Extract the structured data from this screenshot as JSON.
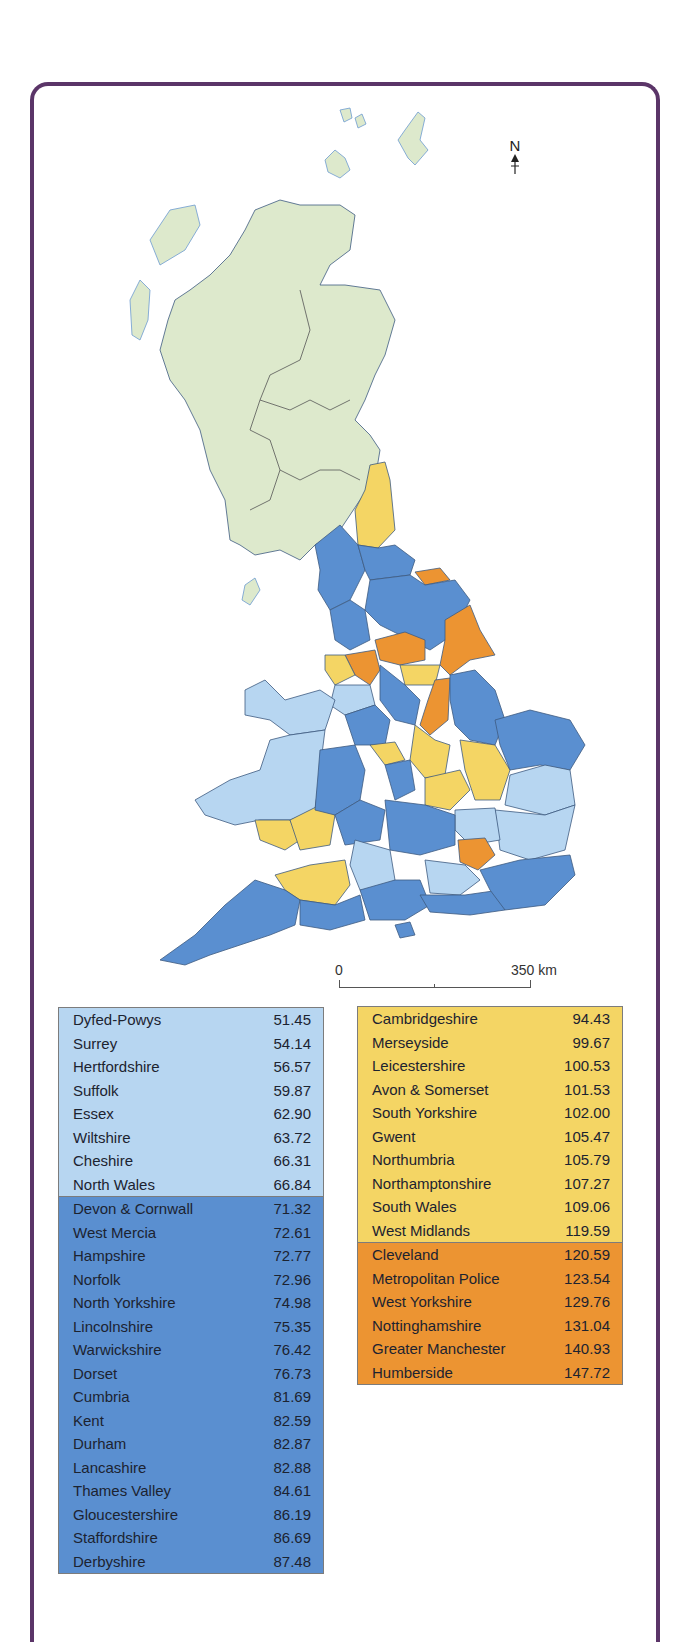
{
  "map": {
    "type": "choropleth",
    "subject": "UK police force areas",
    "north_label": "N",
    "scale": {
      "start_label": "0",
      "end_label": "350 km"
    },
    "colors": {
      "scotland_no_data": "#dde9cc",
      "class_1": "#b7d6f1",
      "class_2": "#5a8fd0",
      "class_3": "#f4d564",
      "class_4": "#ec9432",
      "frame": "#5b3568"
    }
  },
  "legend": {
    "left": {
      "groups": [
        {
          "class": "class_1",
          "items": [
            {
              "name": "Dyfed-Powys",
              "value": "51.45"
            },
            {
              "name": "Surrey",
              "value": "54.14"
            },
            {
              "name": "Hertfordshire",
              "value": "56.57"
            },
            {
              "name": "Suffolk",
              "value": "59.87"
            },
            {
              "name": "Essex",
              "value": "62.90"
            },
            {
              "name": "Wiltshire",
              "value": "63.72"
            },
            {
              "name": "Cheshire",
              "value": "66.31"
            },
            {
              "name": "North Wales",
              "value": "66.84"
            }
          ]
        },
        {
          "class": "class_2",
          "items": [
            {
              "name": "Devon & Cornwall",
              "value": "71.32"
            },
            {
              "name": "West Mercia",
              "value": "72.61"
            },
            {
              "name": "Hampshire",
              "value": "72.77"
            },
            {
              "name": "Norfolk",
              "value": "72.96"
            },
            {
              "name": "North Yorkshire",
              "value": "74.98"
            },
            {
              "name": "Lincolnshire",
              "value": "75.35"
            },
            {
              "name": "Warwickshire",
              "value": "76.42"
            },
            {
              "name": "Dorset",
              "value": "76.73"
            },
            {
              "name": "Cumbria",
              "value": "81.69"
            },
            {
              "name": "Kent",
              "value": "82.59"
            },
            {
              "name": "Durham",
              "value": "82.87"
            },
            {
              "name": "Lancashire",
              "value": "82.88"
            },
            {
              "name": "Thames Valley",
              "value": "84.61"
            },
            {
              "name": "Gloucestershire",
              "value": "86.19"
            },
            {
              "name": "Staffordshire",
              "value": "86.69"
            },
            {
              "name": "Derbyshire",
              "value": "87.48"
            }
          ]
        }
      ]
    },
    "right": {
      "groups": [
        {
          "class": "class_3",
          "items": [
            {
              "name": "Cambridgeshire",
              "value": "94.43"
            },
            {
              "name": "Merseyside",
              "value": "99.67"
            },
            {
              "name": "Leicestershire",
              "value": "100.53"
            },
            {
              "name": "Avon & Somerset",
              "value": "101.53"
            },
            {
              "name": "South Yorkshire",
              "value": "102.00"
            },
            {
              "name": "Gwent",
              "value": "105.47"
            },
            {
              "name": "Northumbria",
              "value": "105.79"
            },
            {
              "name": "Northamptonshire",
              "value": "107.27"
            },
            {
              "name": "South Wales",
              "value": "109.06"
            },
            {
              "name": "West Midlands",
              "value": "119.59"
            }
          ]
        },
        {
          "class": "class_4",
          "items": [
            {
              "name": "Cleveland",
              "value": "120.59"
            },
            {
              "name": "Metropolitan Police",
              "value": "123.54"
            },
            {
              "name": "West Yorkshire",
              "value": "129.76"
            },
            {
              "name": "Nottinghamshire",
              "value": "131.04"
            },
            {
              "name": "Greater Manchester",
              "value": "140.93"
            },
            {
              "name": "Humberside",
              "value": "147.72"
            }
          ]
        }
      ]
    }
  }
}
